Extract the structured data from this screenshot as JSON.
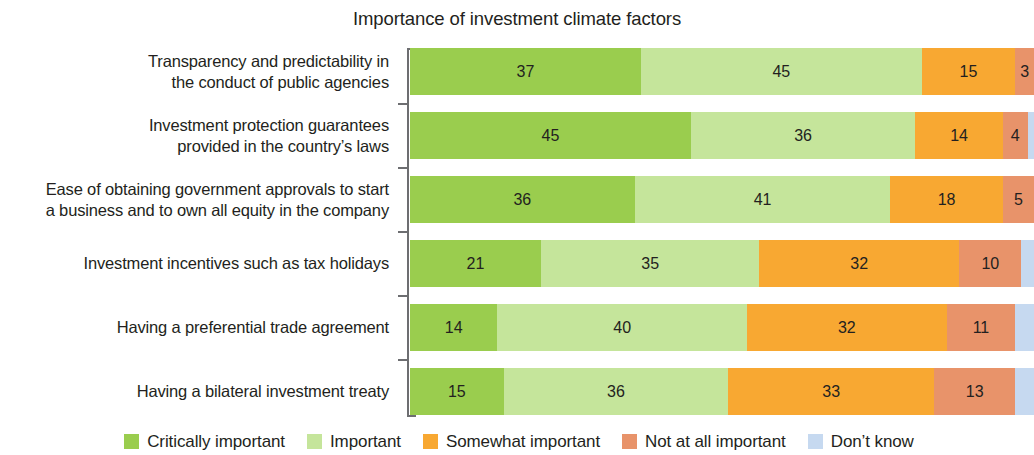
{
  "chart_data": {
    "type": "bar",
    "subtype": "stacked-horizontal-100",
    "title": "Importance of investment climate factors",
    "xlabel": "",
    "ylabel": "",
    "xlim": [
      0,
      100
    ],
    "grid": false,
    "legend_position": "bottom",
    "categories": [
      "Transparency and predictability in the conduct of public agencies",
      "Investment protection guarantees provided in the country’s laws",
      "Ease of obtaining government approvals to start a business and to own all equity in the company",
      "Investment incentives such as tax holidays",
      "Having a preferential trade agreement",
      "Having a bilateral investment treaty"
    ],
    "category_lines": [
      [
        "Transparency and predictability in",
        "the conduct of public agencies"
      ],
      [
        "Investment protection guarantees",
        "provided in the country’s laws"
      ],
      [
        "Ease of obtaining government approvals to start",
        "a business and to own all equity in the company"
      ],
      [
        "Investment incentives such as tax holidays"
      ],
      [
        "Having a preferential trade agreement"
      ],
      [
        "Having a bilateral investment treaty"
      ]
    ],
    "series": [
      {
        "name": "Critically important",
        "color": "#9ACD4E",
        "values": [
          37,
          45,
          36,
          21,
          14,
          15
        ]
      },
      {
        "name": "Important",
        "color": "#C5E59B",
        "values": [
          45,
          36,
          41,
          35,
          40,
          36
        ]
      },
      {
        "name": "Somewhat important",
        "color": "#F8A832",
        "values": [
          15,
          14,
          18,
          32,
          32,
          33
        ]
      },
      {
        "name": "Not at all important",
        "color": "#E8936A",
        "values": [
          3,
          4,
          5,
          10,
          11,
          13
        ]
      },
      {
        "name": "Don’t know",
        "color": "#C6D9F0",
        "values": [
          0,
          1,
          0,
          2,
          3,
          3
        ]
      }
    ],
    "value_labels": [
      [
        "37",
        "45",
        "15",
        "3",
        ""
      ],
      [
        "45",
        "36",
        "14",
        "4",
        ""
      ],
      [
        "36",
        "41",
        "18",
        "5",
        ""
      ],
      [
        "21",
        "35",
        "32",
        "10",
        ""
      ],
      [
        "14",
        "40",
        "32",
        "11",
        ""
      ],
      [
        "15",
        "36",
        "33",
        "13",
        ""
      ]
    ]
  },
  "legend": {
    "items": [
      {
        "label": "Critically important",
        "color": "#9ACD4E"
      },
      {
        "label": "Important",
        "color": "#C5E59B"
      },
      {
        "label": "Somewhat important",
        "color": "#F8A832"
      },
      {
        "label": "Not at all important",
        "color": "#E8936A"
      },
      {
        "label": "Don’t know",
        "color": "#C6D9F0"
      }
    ]
  },
  "axis": {
    "line_color": "#6d6e71"
  }
}
